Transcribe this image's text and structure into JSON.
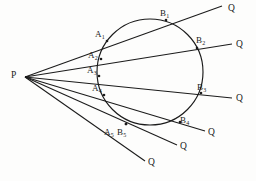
{
  "figure": {
    "width": 256,
    "height": 181,
    "background_color": "#fdfdfc",
    "stroke_color": "#1b1b1b",
    "label_color": "#1b1b1b"
  },
  "circle": {
    "name": "circle",
    "cx": 150,
    "cy": 72,
    "r": 53
  },
  "vertex": {
    "name": "P",
    "label": "P",
    "label_x": 11,
    "label_y": 71,
    "point_x": 25,
    "point_y": 77
  },
  "rays": [
    {
      "id": "ray-1",
      "near_label": "A",
      "near_sub": "1",
      "far_label": "B",
      "far_sub": "1",
      "end_label": "Q",
      "near_x": 107,
      "near_y": 41,
      "far_x": 166,
      "far_y": 20,
      "end_x": 222,
      "end_y": 6,
      "near_label_x": 95,
      "near_label_y": 30,
      "far_label_x": 160,
      "far_label_y": 9,
      "end_label_x": 228,
      "end_label_y": 4
    },
    {
      "id": "ray-2",
      "near_label": "A",
      "near_sub": "2",
      "far_label": "B",
      "far_sub": "2",
      "end_label": "Q",
      "near_x": 101,
      "near_y": 59,
      "far_x": 197,
      "far_y": 48,
      "end_x": 232,
      "end_y": 44,
      "near_label_x": 88,
      "near_label_y": 51,
      "far_label_x": 196,
      "far_label_y": 36,
      "end_label_x": 236,
      "end_label_y": 40
    },
    {
      "id": "ray-3",
      "near_label": "A",
      "near_sub": "3",
      "far_label": "B",
      "far_sub": "3",
      "end_label": "Q",
      "near_x": 99,
      "near_y": 76,
      "far_x": 201,
      "far_y": 93,
      "end_x": 232,
      "end_y": 98,
      "near_label_x": 87,
      "near_label_y": 66,
      "far_label_x": 197,
      "far_label_y": 83,
      "end_label_x": 236,
      "end_label_y": 94
    },
    {
      "id": "ray-4",
      "near_label": "A",
      "near_sub": "4",
      "far_label": "B",
      "far_sub": "4",
      "end_label": "Q",
      "near_x": 104,
      "near_y": 95,
      "far_x": 180,
      "far_y": 122,
      "end_x": 205,
      "end_y": 131,
      "near_label_x": 92,
      "near_label_y": 84,
      "far_label_x": 180,
      "far_label_y": 116,
      "end_label_x": 208,
      "end_label_y": 128
    },
    {
      "id": "ray-5",
      "near_label": "A",
      "near_sub": "5",
      "far_label": "B",
      "far_sub": "5",
      "end_label": "Q",
      "near_x": 126,
      "near_y": 124,
      "far_x": 126,
      "far_y": 124,
      "end_x": 177,
      "end_y": 145,
      "near_label_x": 104,
      "near_label_y": 128,
      "far_label_x": 117,
      "far_label_y": 128,
      "end_label_x": 180,
      "end_label_y": 142
    },
    {
      "id": "ray-6",
      "near_label": "",
      "near_sub": "",
      "far_label": "",
      "far_sub": "",
      "end_label": "Q",
      "near_x": 0,
      "near_y": 0,
      "far_x": 0,
      "far_y": 0,
      "end_x": 145,
      "end_y": 161,
      "near_label_x": 0,
      "near_label_y": 0,
      "far_label_x": 0,
      "far_label_y": 0,
      "end_label_x": 148,
      "end_label_y": 158
    }
  ]
}
